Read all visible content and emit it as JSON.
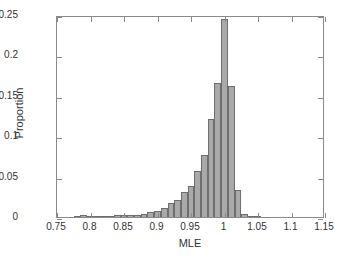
{
  "chart_data": {
    "type": "bar",
    "title": "",
    "subtitle": "",
    "xlabel": "MLE",
    "ylabel": "Proportion",
    "xlim": [
      0.75,
      1.15
    ],
    "ylim": [
      0,
      0.25
    ],
    "xticks": [
      "0.75",
      "0.8",
      "0.85",
      "0.9",
      "0.95",
      "1",
      "1.05",
      "1.1",
      "1.15"
    ],
    "xtick_values": [
      0.75,
      0.8,
      0.85,
      0.9,
      0.95,
      1.0,
      1.05,
      1.1,
      1.15
    ],
    "yticks": [
      "0",
      "0.05",
      "0.1",
      "0.15",
      "0.2",
      "0.25"
    ],
    "ytick_values": [
      0,
      0.05,
      0.1,
      0.15,
      0.2,
      0.25
    ],
    "grid": false,
    "legend": null,
    "bin_width": 0.01,
    "bar_fill_color": "#a9a9a9",
    "bar_edge_color": "#6e6e6e",
    "axis_color": "#8a8a8a",
    "categories": [
      "0.78",
      "0.79",
      "0.80",
      "0.81",
      "0.82",
      "0.83",
      "0.84",
      "0.85",
      "0.86",
      "0.87",
      "0.88",
      "0.89",
      "0.90",
      "0.91",
      "0.92",
      "0.93",
      "0.94",
      "0.95",
      "0.96",
      "0.97",
      "0.98",
      "0.99",
      "1.00",
      "1.01",
      "1.02",
      "1.03",
      "1.04",
      "1.05"
    ],
    "x": [
      0.78,
      0.79,
      0.8,
      0.81,
      0.82,
      0.83,
      0.84,
      0.85,
      0.86,
      0.87,
      0.88,
      0.89,
      0.9,
      0.91,
      0.92,
      0.93,
      0.94,
      0.95,
      0.96,
      0.97,
      0.98,
      0.99,
      1.0,
      1.01,
      1.02,
      1.03,
      1.04,
      1.05
    ],
    "values": [
      0.001,
      0.002,
      0.001,
      0.001,
      0.001,
      0.001,
      0.002,
      0.002,
      0.002,
      0.003,
      0.004,
      0.006,
      0.008,
      0.011,
      0.017,
      0.021,
      0.031,
      0.039,
      0.057,
      0.077,
      0.121,
      0.166,
      0.245,
      0.162,
      0.033,
      0.004,
      0.001,
      0.001
    ]
  },
  "axes": {
    "x_title": "MLE",
    "y_title": "Proportion"
  }
}
